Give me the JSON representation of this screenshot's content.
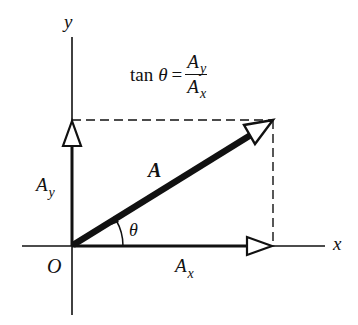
{
  "diagram": {
    "axes": {
      "x_label": "x",
      "y_label": "y",
      "origin_label": "O"
    },
    "vector": {
      "label": "A",
      "angle_label": "θ"
    },
    "components": {
      "x": {
        "base": "A",
        "sub": "x"
      },
      "y": {
        "base": "A",
        "sub": "y"
      }
    },
    "formula": {
      "function": "tan",
      "variable": "θ",
      "equals": "=",
      "numerator": {
        "base": "A",
        "sub": "y"
      },
      "denominator": {
        "base": "A",
        "sub": "x"
      }
    },
    "colors": {
      "ink": "#111111",
      "background": "#ffffff"
    }
  }
}
